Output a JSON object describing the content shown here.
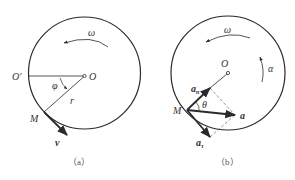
{
  "figure_a": {
    "caption": "（a）",
    "labels": {
      "omega": "ω",
      "o_prime": "O′",
      "o": "O",
      "phi": "φ",
      "r": "r",
      "m": "M",
      "v": "v"
    }
  },
  "figure_b": {
    "caption": "（b）",
    "labels": {
      "omega": "ω",
      "alpha": "α",
      "o": "O",
      "a_n": "a",
      "a_n_sub": "n",
      "theta": "θ",
      "m": "M",
      "a": "a",
      "a_tau": "a",
      "a_tau_sub": "τ"
    }
  },
  "colors": {
    "stroke": "#2a2a2a",
    "dashed": "#666666",
    "text": "#333333"
  }
}
